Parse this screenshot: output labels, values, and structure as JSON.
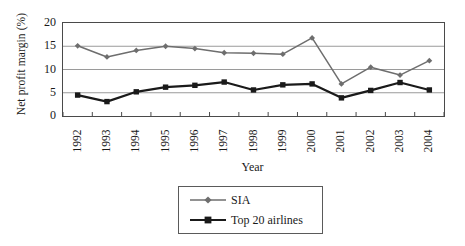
{
  "chart_data": {
    "type": "line",
    "title": "",
    "xlabel": "Year",
    "ylabel": "Net profit margin (%)",
    "categories": [
      "1992",
      "1993",
      "1994",
      "1995",
      "1996",
      "1997",
      "1998",
      "1999",
      "2000",
      "2001",
      "2002",
      "2003",
      "2004"
    ],
    "x": [
      1992,
      1993,
      1994,
      1995,
      1996,
      1997,
      1998,
      1999,
      2000,
      2001,
      2002,
      2003,
      2004
    ],
    "ylim": [
      0,
      20
    ],
    "yticks": [
      0,
      5,
      10,
      15,
      20
    ],
    "ytick_labels": [
      "0",
      "5",
      "10",
      "15",
      "20"
    ],
    "grid": "horizontal",
    "legend_position": "bottom-center",
    "series": [
      {
        "name": "SIA",
        "color": "#6e6e6e",
        "marker": "diamond",
        "values": [
          15.1,
          12.7,
          14.1,
          15.0,
          14.5,
          13.6,
          13.5,
          13.3,
          16.8,
          6.9,
          10.5,
          8.8,
          11.9
        ]
      },
      {
        "name": "Top 20 airlines",
        "color": "#1a1a1a",
        "marker": "square",
        "values": [
          4.5,
          3.1,
          5.2,
          6.2,
          6.6,
          7.3,
          5.6,
          6.7,
          6.9,
          3.9,
          5.5,
          7.2,
          5.6
        ]
      }
    ]
  },
  "axes": {
    "y_title": "Net profit margin (%)",
    "x_title": "Year"
  },
  "legend": {
    "items": [
      {
        "label": "SIA"
      },
      {
        "label": "Top 20 airlines"
      }
    ]
  },
  "colors": {
    "series_sia": "#6e6e6e",
    "series_top20": "#1a1a1a",
    "gridline": "#9a9a9a",
    "frame": "#4a4a4a",
    "background": "#ffffff"
  }
}
